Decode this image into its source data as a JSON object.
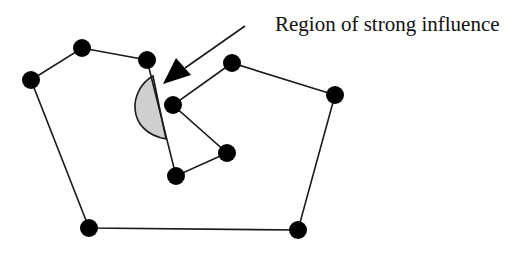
{
  "diagram": {
    "annotation_label": "Region of strong influence",
    "colors": {
      "edge": "#1a1a1a",
      "vertex": "#000000",
      "region_fill": "#cfcfcf",
      "background": "#ffffff"
    },
    "vertices": [
      {
        "id": 1,
        "x": 31,
        "y": 80
      },
      {
        "id": 2,
        "x": 82,
        "y": 48
      },
      {
        "id": 3,
        "x": 147,
        "y": 60
      },
      {
        "id": 4,
        "x": 176,
        "y": 176
      },
      {
        "id": 5,
        "x": 227,
        "y": 153
      },
      {
        "id": 6,
        "x": 173,
        "y": 105
      },
      {
        "id": 7,
        "x": 232,
        "y": 63
      },
      {
        "id": 8,
        "x": 335,
        "y": 95
      },
      {
        "id": 9,
        "x": 298,
        "y": 230
      },
      {
        "id": 10,
        "x": 89,
        "y": 228
      }
    ],
    "polygon_order": [
      1,
      2,
      3,
      4,
      5,
      6,
      7,
      8,
      9,
      10
    ],
    "arrow": {
      "from": [
        245,
        26
      ],
      "to": [
        163,
        84
      ]
    },
    "region": {
      "description": "shaded half-disc on edge between vertex 3 and vertex 4"
    }
  }
}
